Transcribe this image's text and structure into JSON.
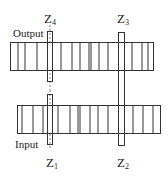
{
  "diagram": {
    "type": "gear-train",
    "labels": {
      "output": "Output",
      "input": "Input"
    },
    "gears": [
      {
        "id": "Z4",
        "letter": "Z",
        "sub": "4",
        "position": "top-left"
      },
      {
        "id": "Z3",
        "letter": "Z",
        "sub": "3",
        "position": "top-right"
      },
      {
        "id": "Z1",
        "letter": "Z",
        "sub": "1",
        "position": "bottom-left"
      },
      {
        "id": "Z2",
        "letter": "Z",
        "sub": "2",
        "position": "bottom-right"
      }
    ],
    "colors": {
      "stroke": "#333333",
      "background": "#ffffff"
    }
  }
}
